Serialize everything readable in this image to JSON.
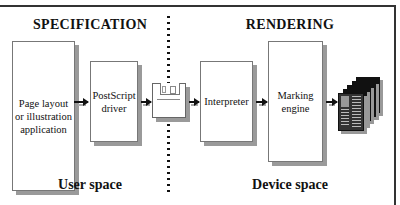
{
  "diagram": {
    "headings": {
      "specification": "SPECIFICATION",
      "rendering": "RENDERING"
    },
    "footers": {
      "user_space": "User space",
      "device_space": "Device space"
    },
    "nodes": [
      {
        "id": "application",
        "label": "Page layout or illustration application",
        "lines": [
          "Page layout",
          "or illustration",
          "application"
        ]
      },
      {
        "id": "driver",
        "label": "PostScript driver",
        "lines": [
          "PostScript",
          "driver"
        ]
      },
      {
        "id": "disk",
        "label": "",
        "icon": "floppy-disk-icon"
      },
      {
        "id": "interpreter",
        "label": "Interpreter",
        "lines": [
          "Interpreter"
        ]
      },
      {
        "id": "engine",
        "label": "Marking engine",
        "lines": [
          "Marking",
          "engine"
        ]
      },
      {
        "id": "output",
        "label": "",
        "icon": "printed-pages-icon"
      }
    ],
    "edges": [
      {
        "from": "application",
        "to": "driver"
      },
      {
        "from": "driver",
        "to": "disk"
      },
      {
        "from": "disk",
        "to": "interpreter"
      },
      {
        "from": "interpreter",
        "to": "engine"
      },
      {
        "from": "engine",
        "to": "output"
      }
    ],
    "colors": {
      "line": "#111111",
      "shadow": "#9a9a9a",
      "box_border": "#777777",
      "background": "#ffffff"
    }
  }
}
